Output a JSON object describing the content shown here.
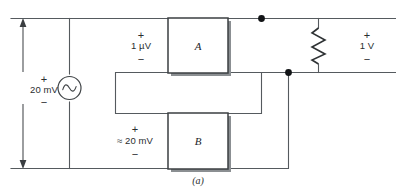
{
  "figure": {
    "caption": "(a)",
    "caption_name": "figure-caption-a"
  },
  "source": {
    "type": "ac-voltage-source",
    "label_value": "20 mV",
    "plus": "+",
    "minus": "−",
    "icon": "ac-source-sine-icon"
  },
  "blocks": [
    {
      "id": "A",
      "letter": "A",
      "name": "amplifier-block-a"
    },
    {
      "id": "B",
      "letter": "B",
      "name": "amplifier-block-b"
    }
  ],
  "labels": {
    "input_a": {
      "plus": "+",
      "value": "1 µV",
      "minus": "−"
    },
    "input_b": {
      "plus": "+",
      "value": "≈ 20 mV",
      "minus": "−"
    },
    "output": {
      "plus": "+",
      "value": "1 V",
      "minus": "−"
    }
  },
  "load": {
    "type": "resistor",
    "name": "load-resistor"
  },
  "nodes": [
    {
      "name": "junction-dot-top"
    },
    {
      "name": "junction-dot-bottom"
    }
  ],
  "colors": {
    "wire": "#555a5e",
    "box_stroke": "#3b3f42",
    "box_shadow": "#8b8f92",
    "node": "#121416",
    "text": "#2a2e30",
    "background": "#ffffff"
  }
}
